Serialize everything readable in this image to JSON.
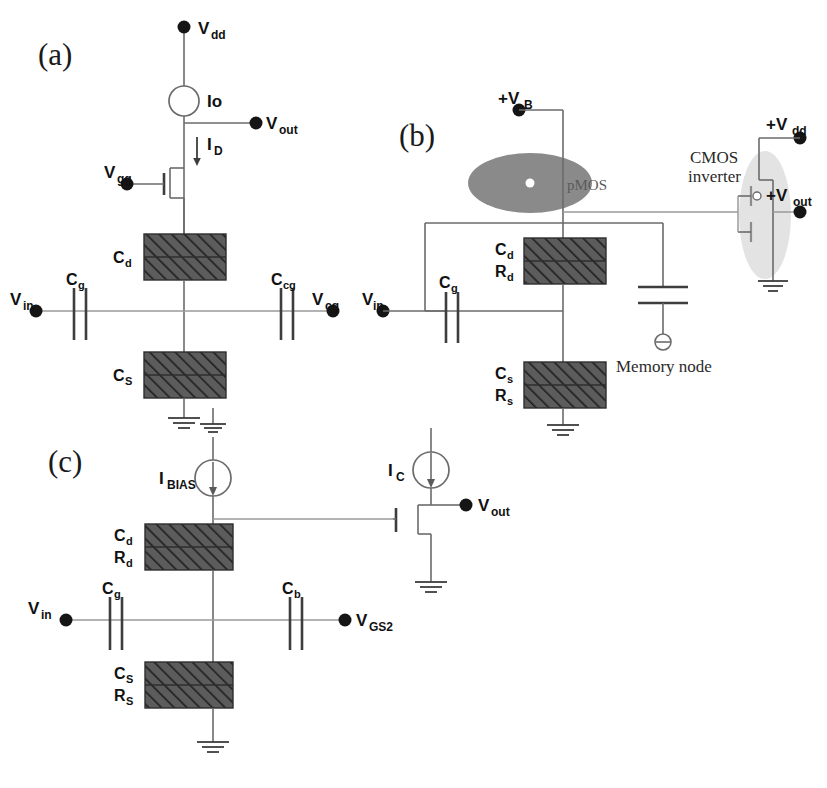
{
  "figure": {
    "background": "#ffffff",
    "ink": "#333333",
    "hatch_fill": "#5a5a5a",
    "pmos_fill": "#8a8a8a"
  },
  "panel_a": {
    "letter": "(a)",
    "vdd": "V",
    "vdd_sub": "dd",
    "source": "Io",
    "current": "I",
    "current_sub": "D",
    "vout": "V",
    "vout_sub": "out",
    "vgg": "V",
    "vgg_sub": "gg",
    "cd": "C",
    "cd_sub": "d",
    "cs": "C",
    "cs_sub": "S",
    "vin": "V",
    "vin_sub": "in",
    "cg": "C",
    "cg_sub": "g",
    "ccg": "C",
    "ccg_sub": "cg",
    "vcg": "V",
    "vcg_sub": "cg"
  },
  "panel_b": {
    "letter": "(b)",
    "vb": "+V",
    "vb_sub": "B",
    "pmos": "pMOS",
    "cmos_line1": "CMOS",
    "cmos_line2": "inverter",
    "vdd": "+V",
    "vdd_sub": "dd",
    "vout": "+V",
    "vout_sub": "out",
    "cd": "C",
    "cd_sub": "d",
    "rd": "R",
    "rd_sub": "d",
    "cs": "C",
    "cs_sub": "s",
    "rs": "R",
    "rs_sub": "s",
    "vin": "V",
    "vin_sub": "in",
    "cg": "C",
    "cg_sub": "g",
    "memory_node": "Memory node"
  },
  "panel_c": {
    "letter": "(c)",
    "ibias": "I",
    "ibias_sub": "BIAS",
    "ic": "I",
    "ic_sub": "C",
    "vout": "V",
    "vout_sub": "out",
    "cd": "C",
    "cd_sub": "d",
    "rd": "R",
    "rd_sub": "d",
    "cs": "C",
    "cs_sub": "S",
    "rs": "R",
    "rs_sub": "S",
    "vin": "V",
    "vin_sub": "in",
    "cg": "C",
    "cg_sub": "g",
    "cb": "C",
    "cb_sub": "b",
    "vgs2": "V",
    "vgs2_sub": "GS2"
  }
}
